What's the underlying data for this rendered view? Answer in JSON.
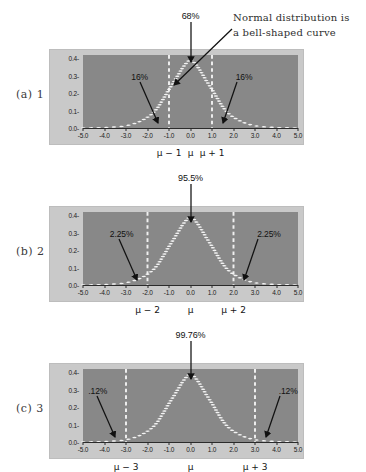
{
  "page": {
    "background_color": "#ffffff",
    "panel_color": "#c9c9c9",
    "plot_color": "#888888",
    "curve_color": "#f2f2f2",
    "arrow_color": "#111111"
  },
  "handwritten_note": {
    "line1": "Normal distribution is",
    "line2": "a bell-shaped curve"
  },
  "axis": {
    "y_labels": [
      "0.4-",
      "0.3-",
      "0.2-",
      "0.1-",
      "0.0-"
    ],
    "y_values": [
      0.4,
      0.3,
      0.2,
      0.1,
      0.0
    ],
    "x_labels": [
      "-5.0",
      "-4.0",
      "-3.0",
      "-2.0",
      "-1.0",
      "0.0",
      "1.0",
      "2.0",
      "3.0",
      "4.0",
      "5.0"
    ],
    "x_values": [
      -5,
      -4,
      -3,
      -2,
      -1,
      0,
      1,
      2,
      3,
      4,
      5
    ]
  },
  "figures": [
    {
      "id": "a",
      "index_label": "(a) 1",
      "sd": 1,
      "center_pct": "68%",
      "left_pct": "16%",
      "right_pct": "16%",
      "mu_left": "μ − 1",
      "mu_center": "μ",
      "mu_right": "μ + 1"
    },
    {
      "id": "b",
      "index_label": "(b) 2",
      "sd": 2,
      "center_pct": "95.5%",
      "left_pct": "2.25%",
      "right_pct": "2.25%",
      "mu_left": "μ − 2",
      "mu_center": "μ",
      "mu_right": "μ + 2"
    },
    {
      "id": "c",
      "index_label": "(c) 3",
      "sd": 3,
      "center_pct": "99.76%",
      "left_pct": ".12%",
      "right_pct": ".12%",
      "mu_left": "μ − 3",
      "mu_center": "μ",
      "mu_right": "μ + 3"
    }
  ],
  "chart_data": {
    "type": "line",
    "title": "Normal distribution is a bell-shaped curve",
    "xlabel": "",
    "ylabel": "",
    "xlim": [
      -5,
      5
    ],
    "ylim": [
      0,
      0.42
    ],
    "grid": false,
    "legend": false,
    "xticks": [
      -5,
      -4,
      -3,
      -2,
      -1,
      0,
      1,
      2,
      3,
      4,
      5
    ],
    "xticklabels": [
      "-5.0",
      "-4.0",
      "-3.0",
      "-2.0",
      "-1.0",
      "0.0",
      "1.0",
      "2.0",
      "3.0",
      "4.0",
      "5.0"
    ],
    "yticks": [
      0.0,
      0.1,
      0.2,
      0.3,
      0.4
    ],
    "yticklabels": [
      "0.0",
      "0.1",
      "0.2",
      "0.3",
      "0.4"
    ],
    "panels": [
      {
        "panel": "(a) 1",
        "series": [
          {
            "name": "standard normal pdf",
            "x": [
              -5,
              -4.5,
              -4,
              -3.5,
              -3,
              -2.5,
              -2,
              -1.5,
              -1,
              -0.5,
              0,
              0.5,
              1,
              1.5,
              2,
              2.5,
              3,
              3.5,
              4,
              4.5,
              5
            ],
            "values": [
              1e-06,
              2e-05,
              0.00013,
              0.00087,
              0.00443,
              0.01753,
              0.05399,
              0.12952,
              0.24197,
              0.35207,
              0.39894,
              0.35207,
              0.24197,
              0.12952,
              0.05399,
              0.01753,
              0.00443,
              0.00087,
              0.00013,
              2e-05,
              1e-06
            ]
          }
        ],
        "vlines": [
          -1,
          1
        ],
        "annotations": [
          {
            "text": "68%",
            "region": "center",
            "between": [
              -1,
              1
            ]
          },
          {
            "text": "16%",
            "region": "left-tail",
            "below": -1
          },
          {
            "text": "16%",
            "region": "right-tail",
            "above": 1
          }
        ],
        "xaxis_secondary": [
          "μ − 1",
          "μ",
          "μ + 1"
        ]
      },
      {
        "panel": "(b) 2",
        "series": [
          {
            "name": "standard normal pdf",
            "x": [
              -5,
              -4.5,
              -4,
              -3.5,
              -3,
              -2.5,
              -2,
              -1.5,
              -1,
              -0.5,
              0,
              0.5,
              1,
              1.5,
              2,
              2.5,
              3,
              3.5,
              4,
              4.5,
              5
            ],
            "values": [
              1e-06,
              2e-05,
              0.00013,
              0.00087,
              0.00443,
              0.01753,
              0.05399,
              0.12952,
              0.24197,
              0.35207,
              0.39894,
              0.35207,
              0.24197,
              0.12952,
              0.05399,
              0.01753,
              0.00443,
              0.00087,
              0.00013,
              2e-05,
              1e-06
            ]
          }
        ],
        "vlines": [
          -2,
          2
        ],
        "annotations": [
          {
            "text": "95.5%",
            "region": "center",
            "between": [
              -2,
              2
            ]
          },
          {
            "text": "2.25%",
            "region": "left-tail",
            "below": -2
          },
          {
            "text": "2.25%",
            "region": "right-tail",
            "above": 2
          }
        ],
        "xaxis_secondary": [
          "μ − 2",
          "μ",
          "μ + 2"
        ]
      },
      {
        "panel": "(c) 3",
        "series": [
          {
            "name": "standard normal pdf",
            "x": [
              -5,
              -4.5,
              -4,
              -3.5,
              -3,
              -2.5,
              -2,
              -1.5,
              -1,
              -0.5,
              0,
              0.5,
              1,
              1.5,
              2,
              2.5,
              3,
              3.5,
              4,
              4.5,
              5
            ],
            "values": [
              1e-06,
              2e-05,
              0.00013,
              0.00087,
              0.00443,
              0.01753,
              0.05399,
              0.12952,
              0.24197,
              0.35207,
              0.39894,
              0.35207,
              0.24197,
              0.12952,
              0.05399,
              0.01753,
              0.00443,
              0.00087,
              0.00013,
              2e-05,
              1e-06
            ]
          }
        ],
        "vlines": [
          -3,
          3
        ],
        "annotations": [
          {
            "text": "99.76%",
            "region": "center",
            "between": [
              -3,
              3
            ]
          },
          {
            "text": ".12%",
            "region": "left-tail",
            "below": -3
          },
          {
            "text": ".12%",
            "region": "right-tail",
            "above": 3
          }
        ],
        "xaxis_secondary": [
          "μ − 3",
          "μ",
          "μ + 3"
        ]
      }
    ]
  }
}
